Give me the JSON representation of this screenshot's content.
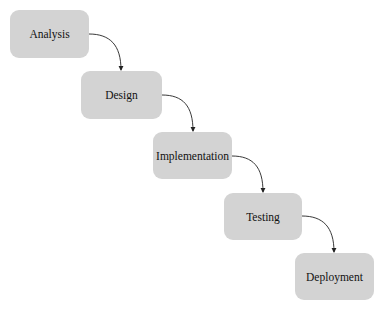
{
  "diagram": {
    "type": "waterfall-flow",
    "node_color": "#d3d3d3",
    "edge_color": "#222222",
    "nodes": [
      {
        "id": "analysis",
        "label": "Analysis",
        "x": 10,
        "y": 10,
        "w": 79,
        "h": 48
      },
      {
        "id": "design",
        "label": "Design",
        "x": 81,
        "y": 71,
        "w": 81,
        "h": 48
      },
      {
        "id": "implementation",
        "label": "Implementation",
        "x": 153,
        "y": 132,
        "w": 79,
        "h": 47
      },
      {
        "id": "testing",
        "label": "Testing",
        "x": 224,
        "y": 193,
        "w": 78,
        "h": 47
      },
      {
        "id": "deployment",
        "label": "Deployment",
        "x": 295,
        "y": 253,
        "w": 79,
        "h": 47
      }
    ],
    "edges": [
      {
        "from": "analysis",
        "to": "design"
      },
      {
        "from": "design",
        "to": "implementation"
      },
      {
        "from": "implementation",
        "to": "testing"
      },
      {
        "from": "testing",
        "to": "deployment"
      }
    ]
  }
}
